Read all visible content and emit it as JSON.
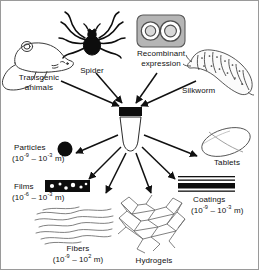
{
  "figure": {
    "center": {
      "label": "Silk",
      "icon": "vial-icon"
    },
    "sources": [
      {
        "id": "transgenic-animals",
        "label_line1": "Transgenic",
        "label_line2": "animals",
        "icon": "mouse-icon"
      },
      {
        "id": "spider",
        "label_line1": "Spider",
        "label_line2": "",
        "icon": "spider-icon"
      },
      {
        "id": "recombinant-expression",
        "label_line1": "Recombinant",
        "label_line2": "expression",
        "icon": "petri-dish-icon"
      },
      {
        "id": "silkworm",
        "label_line1": "Silkworm",
        "label_line2": "",
        "icon": "silkworm-icon"
      }
    ],
    "products": [
      {
        "id": "particles",
        "label": "Particles",
        "range": "(10−9 – 10−3 m)",
        "range_min_exp": "-9",
        "range_max_exp": "-3",
        "icon": "particle-icon"
      },
      {
        "id": "tablets",
        "label": "Tablets",
        "range": "",
        "icon": "tablet-icon"
      },
      {
        "id": "films",
        "label": "Films",
        "range": "(10−6 – 10−3 m)",
        "range_min_exp": "-6",
        "range_max_exp": "-3",
        "icon": "film-icon"
      },
      {
        "id": "coatings",
        "label": "Coatings",
        "range": "(10−9 – 10−3 m)",
        "range_min_exp": "-9",
        "range_max_exp": "-3",
        "icon": "coating-icon"
      },
      {
        "id": "fibers",
        "label": "Fibers",
        "range": "(10−9 – 102 m)",
        "range_min_exp": "-9",
        "range_max_exp": "2",
        "icon": "fiber-icon"
      },
      {
        "id": "hydrogels",
        "label": "Hydrogels",
        "range": "",
        "icon": "hydrogel-icon"
      }
    ],
    "text": {
      "ten": "10",
      "dash": " – ",
      "open": "(",
      "close_m": " m)"
    },
    "colors": {
      "ink": "#111111",
      "line": "#2b2b2b",
      "petri_fill": "#b3b3b3",
      "petri_stroke": "#4d4d4d",
      "black": "#000000",
      "frame": "#9a9a9a",
      "background": "#ffffff"
    }
  }
}
